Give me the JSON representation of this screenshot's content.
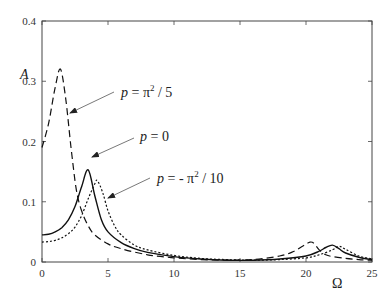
{
  "chart_data": {
    "type": "line",
    "title": "",
    "xlabel": "Ω",
    "ylabel": "A",
    "xlim": [
      0,
      25
    ],
    "ylim": [
      0,
      0.4
    ],
    "xticks": [
      "0",
      "5",
      "10",
      "15",
      "20",
      "25"
    ],
    "yticks": [
      "0",
      "0.1",
      "0.2",
      "0.3",
      "0.4"
    ],
    "grid": false,
    "legend": "none (inline annotations with arrows)",
    "series": [
      {
        "name": "p = π² / 5",
        "style": "dashed",
        "x": [
          0,
          0.5,
          1.0,
          1.4,
          1.8,
          2.2,
          2.6,
          3.0,
          3.5,
          4.0,
          5,
          6,
          8,
          10,
          12,
          14,
          16,
          18,
          19,
          19.8,
          20.3,
          20.6,
          21.0,
          21.5,
          22,
          23,
          24,
          25
        ],
        "values": [
          0.19,
          0.23,
          0.29,
          0.32,
          0.27,
          0.19,
          0.12,
          0.085,
          0.06,
          0.045,
          0.03,
          0.022,
          0.012,
          0.007,
          0.004,
          0.003,
          0.004,
          0.01,
          0.017,
          0.027,
          0.033,
          0.031,
          0.02,
          0.012,
          0.009,
          0.006,
          0.004,
          0.003
        ]
      },
      {
        "name": "p = 0",
        "style": "solid",
        "x": [
          0,
          0.5,
          1.0,
          1.5,
          2.0,
          2.5,
          3.0,
          3.5,
          4.0,
          4.5,
          5,
          6,
          7,
          8,
          10,
          12,
          14,
          16,
          18,
          20,
          21,
          21.5,
          22,
          22.5,
          23,
          24,
          25
        ],
        "values": [
          0.045,
          0.046,
          0.05,
          0.057,
          0.07,
          0.092,
          0.125,
          0.153,
          0.11,
          0.07,
          0.05,
          0.032,
          0.022,
          0.016,
          0.009,
          0.005,
          0.003,
          0.003,
          0.005,
          0.01,
          0.018,
          0.024,
          0.028,
          0.022,
          0.015,
          0.008,
          0.004
        ]
      },
      {
        "name": "p = - π² / 10",
        "style": "dotted",
        "x": [
          0,
          0.5,
          1.0,
          1.5,
          2.0,
          2.5,
          3.0,
          3.5,
          4.0,
          4.2,
          4.6,
          5,
          5.5,
          6,
          7,
          8,
          10,
          12,
          14,
          16,
          18,
          20,
          21,
          22,
          22.5,
          23,
          24,
          25
        ],
        "values": [
          0.033,
          0.034,
          0.036,
          0.04,
          0.047,
          0.058,
          0.077,
          0.105,
          0.13,
          0.135,
          0.115,
          0.085,
          0.06,
          0.045,
          0.028,
          0.02,
          0.011,
          0.006,
          0.004,
          0.003,
          0.004,
          0.007,
          0.012,
          0.02,
          0.026,
          0.021,
          0.01,
          0.005
        ]
      }
    ],
    "annotations": [
      {
        "text": "p = π² / 5",
        "points_to": {
          "x": 2.1,
          "y": 0.24
        },
        "series": "dashed"
      },
      {
        "text": "p = 0",
        "points_to": {
          "x": 3.3,
          "y": 0.17
        },
        "series": "solid"
      },
      {
        "text": "p = - π² / 10",
        "points_to": {
          "x": 4.1,
          "y": 0.135
        },
        "series": "dotted"
      }
    ]
  },
  "labels": {
    "ylabel": "A",
    "xlabel": "Ω",
    "ann1_p": "p",
    "ann1_rest": " = π",
    "ann1_sup": "2",
    "ann1_tail": " / 5",
    "ann2_p": "p",
    "ann2_rest": " = 0",
    "ann3_p": "p",
    "ann3_rest": " = - π",
    "ann3_sup": "2",
    "ann3_tail": " / 10"
  }
}
